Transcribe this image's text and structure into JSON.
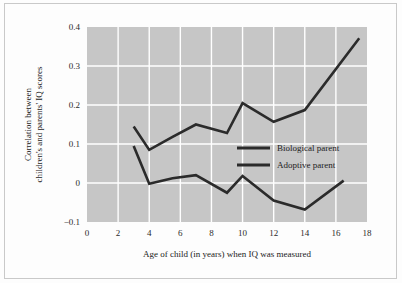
{
  "figure": {
    "background_color": "#fdfdfd",
    "plot_background_color": "#c6c6c6",
    "grid_color": "#ffffff",
    "line_color": "#2b2b2b",
    "border_color": "#c9c9c9"
  },
  "chart_data": {
    "type": "line",
    "title": "",
    "xlabel": "Age of child (in years) when IQ was measured",
    "ylabel": "Correlation between children's and parents' IQ scores",
    "xlim": [
      0,
      18
    ],
    "ylim": [
      -0.1,
      0.4
    ],
    "xticks": [
      0,
      2,
      4,
      6,
      8,
      10,
      12,
      14,
      16,
      18
    ],
    "xtick_labels": [
      "0",
      "2",
      "4",
      "6",
      "8",
      "10",
      "12",
      "14",
      "16",
      "18"
    ],
    "yticks": [
      -0.1,
      0,
      0.1,
      0.2,
      0.3,
      0.4
    ],
    "ytick_labels": [
      "-0.1",
      "0",
      "0.1",
      "0.2",
      "0.3",
      "0.4"
    ],
    "grid": true,
    "grid_axes": "both",
    "legend_position": "center-right",
    "series": [
      {
        "name": "Biological parent",
        "x": [
          3,
          4,
          5.5,
          7,
          9,
          10,
          12,
          14,
          17.5
        ],
        "y": [
          0.145,
          0.085,
          0.118,
          0.15,
          0.128,
          0.205,
          0.157,
          0.187,
          0.371
        ]
      },
      {
        "name": "Adoptive parent",
        "x": [
          3,
          4,
          5.5,
          7,
          9,
          10,
          12,
          14,
          16.5
        ],
        "y": [
          0.095,
          -0.002,
          0.012,
          0.02,
          -0.025,
          0.018,
          -0.045,
          -0.068,
          0.006
        ]
      }
    ]
  },
  "legend": {
    "entries": [
      {
        "label": "Biological parent"
      },
      {
        "label": "Adoptive parent"
      }
    ]
  }
}
